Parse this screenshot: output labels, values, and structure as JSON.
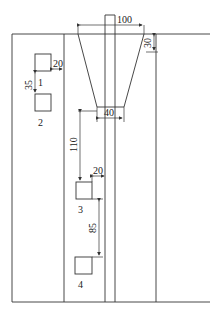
{
  "diagram": {
    "type": "engineering-layout",
    "dimensions": {
      "top_width": "100",
      "top_offset": "30",
      "bottom_width": "40",
      "box1_side_gap": "20",
      "box1_box2_gap": "35",
      "trapezoid_to_box3": "110",
      "box3_side_gap": "20",
      "box3_box4_gap": "85"
    },
    "boxes": [
      {
        "id": "1",
        "label": "1"
      },
      {
        "id": "2",
        "label": "2"
      },
      {
        "id": "3",
        "label": "3"
      },
      {
        "id": "4",
        "label": "4"
      }
    ]
  }
}
